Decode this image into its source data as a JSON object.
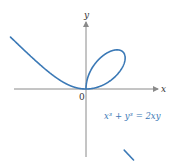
{
  "diagram": {
    "axes": {
      "x_label": "x",
      "y_label": "y",
      "origin_label": "0"
    },
    "equation": {
      "text": "x³ + y³ = 2xy",
      "color": "#3b79b6"
    },
    "curve_color": "#3b79b6",
    "axis_color": "#8a8a8a"
  }
}
